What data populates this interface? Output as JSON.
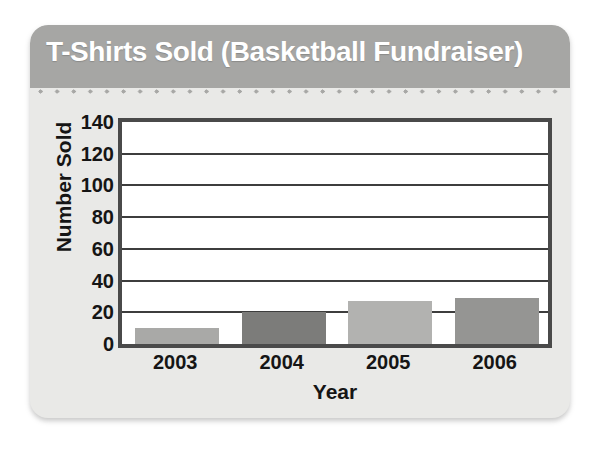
{
  "card": {
    "title": "T-Shirts Sold (Basketball Fundraiser)"
  },
  "chart_data": {
    "type": "bar",
    "title": "T-Shirts Sold (Basketball Fundraiser)",
    "xlabel": "Year",
    "ylabel": "Number Sold",
    "categories": [
      "2003",
      "2004",
      "2005",
      "2006"
    ],
    "values": [
      10,
      20,
      27,
      29
    ],
    "bar_colors": [
      "#a9a9a7",
      "#7c7c7a",
      "#b2b2b0",
      "#959593"
    ],
    "ylim": [
      0,
      140
    ],
    "ytick_labels": [
      "140",
      "120",
      "100",
      "80",
      "60",
      "40",
      "20",
      "0"
    ],
    "ytick_values": [
      140,
      120,
      100,
      80,
      60,
      40,
      20,
      0
    ],
    "ytick_step": 20,
    "gridlines": [
      120,
      100,
      80,
      60,
      40,
      20
    ],
    "grid": true,
    "legend": "none",
    "frame_color": "#4a4a4a",
    "plot_background": "#ffffff"
  }
}
